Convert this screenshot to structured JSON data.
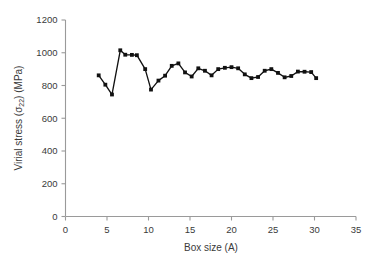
{
  "chart_data": {
    "type": "line",
    "title": "",
    "xlabel": "Box size (A)",
    "ylabel_parts": {
      "pre": "Virial stress (",
      "sym": "σ",
      "sub": "22",
      "post": ") (MPa)"
    },
    "ylabel": "Virial stress (σ22) (MPa)",
    "xlim": [
      0,
      35
    ],
    "ylim": [
      0,
      1200
    ],
    "xticks": [
      0,
      5,
      10,
      15,
      20,
      25,
      30,
      35
    ],
    "yticks": [
      0,
      200,
      400,
      600,
      800,
      1000,
      1200
    ],
    "xticklabels": [
      "0",
      "5",
      "10",
      "15",
      "20",
      "25",
      "30",
      "35"
    ],
    "yticklabels": [
      "0",
      "200",
      "400",
      "600",
      "800",
      "1000",
      "1200"
    ],
    "grid": false,
    "legend": "none",
    "marker": "square",
    "series": [
      {
        "name": "Virial stress",
        "color": "#111111",
        "x": [
          4.0,
          4.8,
          5.6,
          6.6,
          7.2,
          8.0,
          8.6,
          9.6,
          10.3,
          11.2,
          12.0,
          12.8,
          13.6,
          14.4,
          15.2,
          16.0,
          16.8,
          17.6,
          18.4,
          19.2,
          20.0,
          20.8,
          21.6,
          22.4,
          23.2,
          24.0,
          24.8,
          25.6,
          26.4,
          27.2,
          28.0,
          28.8,
          29.6,
          30.2
        ],
        "y": [
          862,
          805,
          745,
          1015,
          988,
          987,
          985,
          900,
          775,
          830,
          860,
          920,
          935,
          880,
          855,
          905,
          890,
          862,
          900,
          908,
          912,
          905,
          868,
          845,
          852,
          890,
          900,
          877,
          850,
          858,
          885,
          884,
          882,
          845
        ]
      }
    ]
  }
}
